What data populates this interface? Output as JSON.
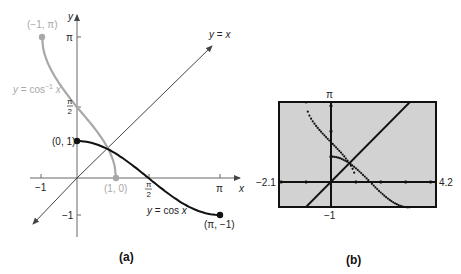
{
  "chart_data": [
    {
      "id": "a",
      "type": "line",
      "caption": "(a)",
      "axes": {
        "xlabel": "x",
        "ylabel": "y",
        "x_ticks": [
          "-1",
          "π/2",
          "π"
        ],
        "y_ticks": [
          "π",
          "π/2",
          "-1"
        ],
        "grid": false
      },
      "series": [
        {
          "name": "y = cos x",
          "label": "y = cos x",
          "color": "#111111",
          "domain": [
            0,
            3.14159
          ],
          "points": [
            [
              0,
              1
            ],
            [
              0.785,
              0.707
            ],
            [
              1.571,
              0
            ],
            [
              2.356,
              -0.707
            ],
            [
              3.142,
              -1
            ]
          ],
          "endpoints": [
            {
              "label": "(0, 1)",
              "x": 0,
              "y": 1
            },
            {
              "label": "(π, −1)",
              "x": 3.14159,
              "y": -1
            }
          ]
        },
        {
          "name": "y = cos⁻¹ x",
          "label": "y = cos⁻¹ x",
          "color": "#a8a8a8",
          "domain": [
            -1,
            1
          ],
          "points": [
            [
              -1,
              3.142
            ],
            [
              -0.5,
              2.094
            ],
            [
              0,
              1.571
            ],
            [
              0.5,
              1.047
            ],
            [
              1,
              0
            ]
          ],
          "endpoints": [
            {
              "label": "(−1, π)",
              "x": -1,
              "y": 3.14159
            },
            {
              "label": "(1, 0)",
              "x": 1,
              "y": 0
            }
          ]
        },
        {
          "name": "y = x",
          "label": "y = x",
          "color": "#444444",
          "points": [
            [
              -1.2,
              -1.2
            ],
            [
              3.0,
              3.0
            ]
          ]
        }
      ]
    },
    {
      "id": "b",
      "type": "line",
      "caption": "(b)",
      "window": {
        "xmin": -2.1,
        "xmax": 4.2,
        "ymin": -1,
        "ymax": 3.14159
      },
      "window_labels": {
        "xmin": "−2.1",
        "xmax": "4.2",
        "ymin": "−1",
        "ymax": "π"
      },
      "background": "#cfcfcf",
      "series": [
        {
          "name": "y = cos x",
          "domain": [
            0,
            3.14159
          ],
          "style": "dotted"
        },
        {
          "name": "y = cos⁻¹ x",
          "domain": [
            -1,
            1
          ],
          "style": "dotted"
        },
        {
          "name": "y = x",
          "style": "solid"
        }
      ]
    }
  ],
  "labels": {
    "a": {
      "y_axis": "y",
      "x_axis": "x",
      "tick_pi_y": "π",
      "tick_half_pi_num": "π",
      "tick_half_pi_den": "2",
      "tick_neg1_x": "−1",
      "tick_neg1_y": "−1",
      "tick_pi_x": "π",
      "pt_neg1_pi": "(−1, π)",
      "pt_0_1": "(0, 1)",
      "pt_1_0": "(1, 0)",
      "pt_pi_neg1": "(π, −1)",
      "curve_arccos": "y = cos",
      "curve_arccos_sup": "−1",
      "curve_arccos_x": "x",
      "curve_cos": "y = cos x",
      "line_yx": "y = x",
      "caption": "(a)"
    },
    "b": {
      "ymax": "π",
      "xmin": "−2.1",
      "xmax": "4.2",
      "ymin": "−1",
      "caption": "(b)"
    }
  }
}
